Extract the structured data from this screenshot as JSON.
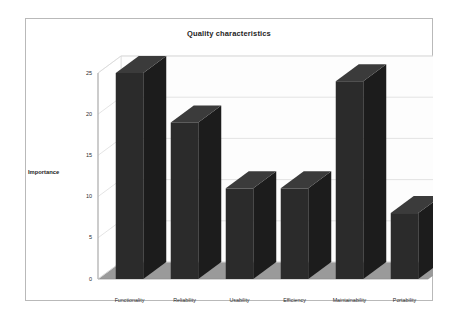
{
  "chart_data": {
    "type": "bar",
    "title": "Quality characteristics",
    "xlabel": "",
    "ylabel": "Importance",
    "categories": [
      "Functionality",
      "Reliability",
      "Usability",
      "Efficiency",
      "Maintainability",
      "Portability"
    ],
    "values": [
      25,
      19,
      11,
      11,
      24,
      8
    ],
    "yticks": [
      "0",
      "5",
      "10",
      "15",
      "20",
      "25"
    ],
    "ytick_values": [
      0,
      5,
      10,
      15,
      20,
      25
    ],
    "ylim": [
      0,
      25
    ],
    "grid": true,
    "legend": "none",
    "style": "3d-column",
    "colors": {
      "bar_front": "#2b2b2b",
      "bar_top": "#3b3b3b",
      "bar_side": "#1c1c1c",
      "floor": "#9a9a9a",
      "wall": "#fdfdfd",
      "gridline": "#d8d8d8",
      "frame": "#b9b9b9",
      "text": "#1d1d1d"
    }
  }
}
